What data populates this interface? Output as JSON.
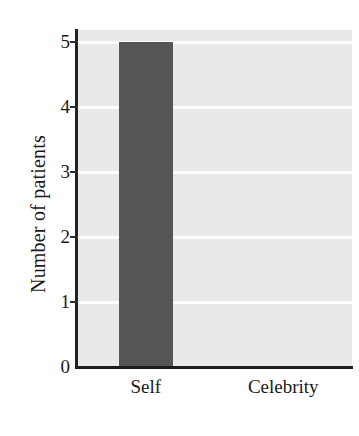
{
  "chart_data": {
    "type": "bar",
    "title": "",
    "subtitle": "",
    "xlabel": "",
    "ylabel": "Number of patients",
    "categories": [
      "Self",
      "Celebrity"
    ],
    "values": [
      5,
      0
    ],
    "series": [
      {
        "name": "Number of patients",
        "values": [
          5,
          0
        ]
      }
    ],
    "ylim": [
      0,
      5
    ],
    "y_ticks": [
      0,
      1,
      2,
      3,
      4,
      5
    ],
    "y_tick_labels": [
      "0",
      "1",
      "2",
      "3",
      "4",
      "5"
    ],
    "grid": true,
    "grid_axis": "y",
    "legend": false,
    "legend_position": "none",
    "annotations": [],
    "colors": {
      "bar": "#555555",
      "plot_background": "#e9e9e9",
      "gridline": "#fdfdfd",
      "axis": "#1d1d1d",
      "text": "#1a1a1a",
      "figure_background": "#ffffff"
    }
  }
}
